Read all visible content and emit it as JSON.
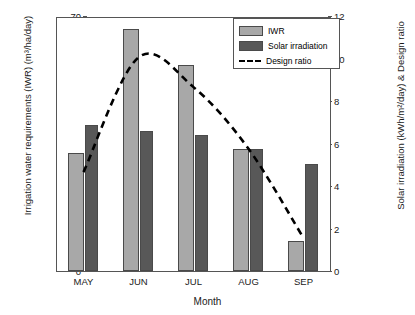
{
  "chart_data": {
    "type": "bar",
    "title": "",
    "xlabel": "Month",
    "ylabel": "Irrigation water requirements (IWR)  (m³/ha/day)",
    "ylabel_right": "Solar irradiation (kWh/m²/day) & Design ratio",
    "categories": [
      "MAY",
      "JUN",
      "JUL",
      "AUG",
      "SEP"
    ],
    "ylim": [
      0,
      70
    ],
    "ylim_right": [
      0,
      12
    ],
    "yticks": [
      0,
      10,
      20,
      30,
      40,
      50,
      60,
      70
    ],
    "yticks_right": [
      0,
      2,
      4,
      6,
      8,
      10,
      12
    ],
    "grid": false,
    "legend_position": "top-right",
    "series": [
      {
        "name": "IWR",
        "axis": "left",
        "kind": "bar",
        "color": "#a8a8a8",
        "values": [
          32.5,
          66.5,
          56.5,
          33.5,
          8.3
        ]
      },
      {
        "name": "Solar irradiation",
        "axis": "right",
        "kind": "bar",
        "color": "#585858",
        "values": [
          6.85,
          6.6,
          6.4,
          5.75,
          5.05
        ]
      },
      {
        "name": "Design ratio",
        "axis": "right",
        "kind": "line-dashed",
        "color": "#000000",
        "values": [
          4.7,
          10.1,
          8.7,
          5.8,
          1.6
        ]
      }
    ]
  },
  "legend": {
    "items": [
      {
        "label": "IWR",
        "swatch": "iwr"
      },
      {
        "label": "Solar irradiation",
        "swatch": "sol"
      },
      {
        "label": "Design ratio",
        "swatch": "line"
      }
    ]
  },
  "axes": {
    "x_title": "Month",
    "y_left_title": "Irrigation water requirements (IWR)  (m³/ha/day)",
    "y_right_title": "Solar irradiation (kWh/m²/day) & Design ratio",
    "y_left_ticks": [
      "70",
      "60",
      "50",
      "40",
      "30",
      "20",
      "10",
      "0"
    ],
    "y_right_ticks": [
      "12",
      "10",
      "8",
      "6",
      "4",
      "2",
      "0"
    ],
    "x_ticks": [
      "MAY",
      "JUN",
      "JUL",
      "AUG",
      "SEP"
    ]
  }
}
